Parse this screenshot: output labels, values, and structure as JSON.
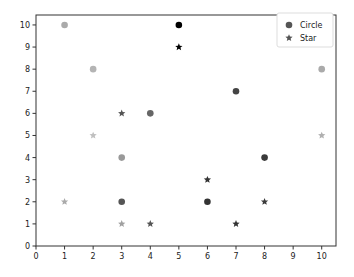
{
  "chart_data": {
    "type": "scatter",
    "title": "",
    "xlabel": "",
    "ylabel": "",
    "xlim": [
      0,
      10.5
    ],
    "ylim": [
      0,
      10.45
    ],
    "grid": false,
    "legend_position": "upper right",
    "x_ticks": [
      "0",
      "1",
      "2",
      "3",
      "4",
      "5",
      "6",
      "7",
      "8",
      "9",
      "10"
    ],
    "y_ticks": [
      "0",
      "1",
      "2",
      "3",
      "4",
      "5",
      "6",
      "7",
      "8",
      "9",
      "10"
    ],
    "series": [
      {
        "name": "Circle",
        "marker": "circle",
        "legend_color": "#555555",
        "points": [
          {
            "x": 1,
            "y": 10,
            "color": "#aaaaaa"
          },
          {
            "x": 2,
            "y": 8,
            "color": "#b4b4b4"
          },
          {
            "x": 3,
            "y": 4,
            "color": "#999999"
          },
          {
            "x": 3,
            "y": 2,
            "color": "#555555"
          },
          {
            "x": 4,
            "y": 6,
            "color": "#666666"
          },
          {
            "x": 5,
            "y": 10,
            "color": "#000000"
          },
          {
            "x": 6,
            "y": 2,
            "color": "#333333"
          },
          {
            "x": 7,
            "y": 7,
            "color": "#444444"
          },
          {
            "x": 8,
            "y": 4,
            "color": "#3a3a3a"
          },
          {
            "x": 10,
            "y": 8,
            "color": "#aaaaaa"
          }
        ]
      },
      {
        "name": "Star",
        "marker": "star",
        "legend_color": "#555555",
        "points": [
          {
            "x": 1,
            "y": 2,
            "color": "#aaaaaa"
          },
          {
            "x": 2,
            "y": 5,
            "color": "#c0c0c0"
          },
          {
            "x": 3,
            "y": 6,
            "color": "#555555"
          },
          {
            "x": 3,
            "y": 1,
            "color": "#a0a0a0"
          },
          {
            "x": 4,
            "y": 1,
            "color": "#555555"
          },
          {
            "x": 5,
            "y": 9,
            "color": "#000000"
          },
          {
            "x": 6,
            "y": 3,
            "color": "#333333"
          },
          {
            "x": 7,
            "y": 1,
            "color": "#333333"
          },
          {
            "x": 8,
            "y": 2,
            "color": "#3a3a3a"
          },
          {
            "x": 10,
            "y": 5,
            "color": "#b0b0b0"
          }
        ]
      }
    ]
  }
}
